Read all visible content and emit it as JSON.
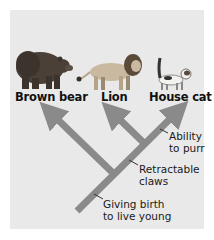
{
  "diagram": {
    "type": "cladogram",
    "taxa": [
      {
        "id": "bear",
        "label": "Brown bear"
      },
      {
        "id": "lion",
        "label": "Lion"
      },
      {
        "id": "cat",
        "label": "House cat"
      }
    ],
    "traits": [
      {
        "id": "purr",
        "line1": "Ability",
        "line2": "to purr"
      },
      {
        "id": "claws",
        "line1": "Retractable",
        "line2": "claws"
      },
      {
        "id": "birth",
        "line1": "Giving birth",
        "line2": "to live young"
      }
    ],
    "colors": {
      "background": "#e9e9e9",
      "branch": "#8a8a8a",
      "text": "#111111"
    }
  }
}
